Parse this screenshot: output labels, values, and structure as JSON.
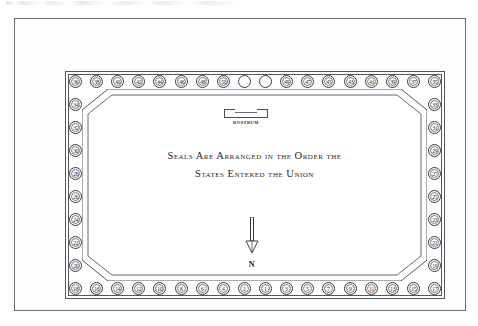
{
  "diagram": {
    "inscription": {
      "line1": "Seals Are Arranged in the Order the",
      "line2": "States Entered the Union"
    },
    "rostrum": {
      "label": "ROSTRUM"
    },
    "compass": {
      "label": "N",
      "arrow_icon": "north-arrow-icon",
      "direction": "down"
    },
    "colors": {
      "ink": "#26262c",
      "line": "#55555a",
      "seal_border": "#3a3a3f",
      "background": "#ffffff"
    },
    "seals": {
      "top_left": [
        {
          "label": "36"
        },
        {
          "label": "38"
        },
        {
          "label": "40"
        },
        {
          "label": "42"
        },
        {
          "label": "44"
        },
        {
          "label": "46"
        },
        {
          "label": "48"
        },
        {
          "label": "50"
        }
      ],
      "top_center_blank": [
        {
          "label": ""
        },
        {
          "label": ""
        }
      ],
      "top_right": [
        {
          "label": "49"
        },
        {
          "label": "47"
        },
        {
          "label": "45"
        },
        {
          "label": "43"
        },
        {
          "label": "41"
        },
        {
          "label": "39"
        },
        {
          "label": "37"
        },
        {
          "label": "35"
        }
      ],
      "left_column": [
        {
          "label": "34"
        },
        {
          "label": "32"
        },
        {
          "label": "30"
        },
        {
          "label": "28"
        },
        {
          "label": "26"
        },
        {
          "label": "24"
        },
        {
          "label": "22"
        },
        {
          "label": "20"
        }
      ],
      "right_column": [
        {
          "label": "33"
        },
        {
          "label": "31"
        },
        {
          "label": "29"
        },
        {
          "label": "27"
        },
        {
          "label": "25"
        },
        {
          "label": "23"
        },
        {
          "label": "21"
        },
        {
          "label": "19"
        }
      ],
      "bottom_left": [
        {
          "label": "18"
        },
        {
          "label": "16"
        },
        {
          "label": "14"
        },
        {
          "label": "12"
        },
        {
          "label": "10"
        },
        {
          "label": "8"
        },
        {
          "label": "6"
        },
        {
          "label": "4"
        },
        {
          "label": "2"
        }
      ],
      "bottom_right": [
        {
          "label": "1"
        },
        {
          "label": "3"
        },
        {
          "label": "5"
        },
        {
          "label": "7"
        },
        {
          "label": "9"
        },
        {
          "label": "11"
        },
        {
          "label": "13"
        },
        {
          "label": "15"
        },
        {
          "label": "17"
        }
      ]
    }
  }
}
